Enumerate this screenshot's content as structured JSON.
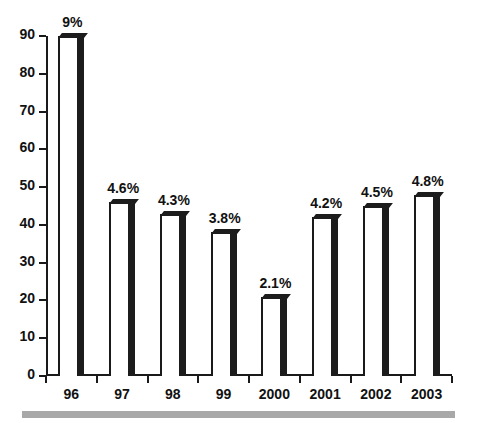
{
  "chart_data": {
    "type": "bar",
    "title": "",
    "subtitle": "",
    "xlabel": "",
    "ylabel": "",
    "categories": [
      "96",
      "97",
      "98",
      "99",
      "2000",
      "2001",
      "2002",
      "2003"
    ],
    "values": [
      90,
      46,
      43,
      38,
      21,
      42,
      45,
      48
    ],
    "data_labels": [
      "9%",
      "4.6%",
      "4.3%",
      "3.8%",
      "2.1%",
      "4.2%",
      "4.5%",
      "4.8%"
    ],
    "ylim": [
      0,
      90
    ],
    "y_ticks": [
      0,
      10,
      20,
      30,
      40,
      50,
      60,
      70,
      80,
      90
    ],
    "y_tick_labels": [
      "0",
      "10",
      "20",
      "30",
      "40",
      "50",
      "60",
      "70",
      "80",
      "90"
    ],
    "grid": false,
    "legend": "none",
    "series": [
      {
        "name": "",
        "values": [
          90,
          46,
          43,
          38,
          21,
          42,
          45,
          48
        ],
        "labels": [
          "9%",
          "4.6%",
          "4.3%",
          "3.8%",
          "2.1%",
          "4.2%",
          "4.5%",
          "4.8%"
        ]
      }
    ]
  },
  "style": {
    "bar_face_color": "#ffffff",
    "bar_shadow_color": "#1c1c1c",
    "axis_color": "#1a1a1a",
    "text_color": "#111111",
    "background_color": "#ffffff",
    "footer_rule_color": "#a8a8a8"
  }
}
